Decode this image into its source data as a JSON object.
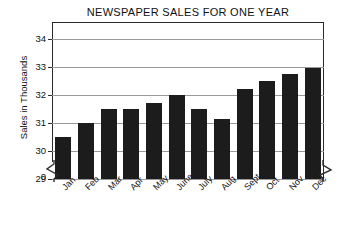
{
  "chart_data": {
    "type": "bar",
    "title": "NEWSPAPER SALES FOR ONE YEAR",
    "xlabel": "",
    "ylabel": "Sales in Thousands",
    "categories": [
      "Jan",
      "Feb",
      "Mar",
      "Apr",
      "May",
      "June",
      "July",
      "Aug",
      "Sept",
      "Oct",
      "Nov",
      "Dec"
    ],
    "values": [
      30.5,
      31.0,
      31.5,
      31.5,
      31.7,
      32.0,
      31.5,
      31.15,
      32.2,
      32.5,
      32.75,
      32.95
    ],
    "ylim": [
      29,
      34.6
    ],
    "yticks": [
      29,
      30,
      31,
      32,
      33,
      34
    ],
    "ytick_labels": [
      "29",
      "30",
      "31",
      "32",
      "33",
      "34"
    ],
    "zero_label": "0",
    "axis_break": true,
    "grid": true,
    "legend": "none",
    "bar_color": "#1c1c1c"
  },
  "figure": {
    "background": "#ffffff",
    "axis_color": "#2b2b2b",
    "grid_color": "#9a9a9a"
  }
}
